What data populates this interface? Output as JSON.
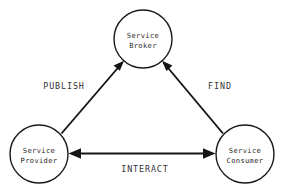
{
  "diagram": {
    "background_color": "#ffffff",
    "stroke_color": "#151515",
    "text_color": "#2b2b2b",
    "nodes": [
      {
        "id": "broker",
        "line1": "Service",
        "line2": "Broker",
        "cx": 143,
        "cy": 39,
        "r": 29
      },
      {
        "id": "provider",
        "line1": "Service",
        "line2": "Provider",
        "cx": 39,
        "cy": 154,
        "r": 29
      },
      {
        "id": "consumer",
        "line1": "Service",
        "line2": "Consumer",
        "cx": 245,
        "cy": 154,
        "r": 29
      }
    ],
    "edges": [
      {
        "id": "publish",
        "label": "PUBLISH",
        "from": "provider",
        "to": "broker",
        "direction": "one-way",
        "label_x": 64,
        "label_y": 89
      },
      {
        "id": "find",
        "label": "FIND",
        "from": "consumer",
        "to": "broker",
        "direction": "one-way",
        "label_x": 220,
        "label_y": 89
      },
      {
        "id": "interact",
        "label": "INTERACT",
        "from": "provider",
        "to": "consumer",
        "direction": "two-way",
        "label_x": 145,
        "label_y": 172
      }
    ]
  }
}
